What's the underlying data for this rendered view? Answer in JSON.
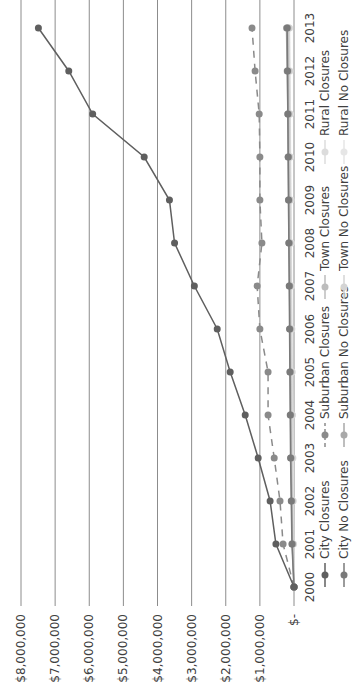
{
  "chart_data": {
    "type": "line",
    "orientation": "rotated 90 degrees counterclockwise",
    "title": "",
    "xlabel": "",
    "ylabel": "",
    "x": [
      "2000",
      "2001",
      "2002",
      "2003",
      "2004",
      "2005",
      "2006",
      "2007",
      "2008",
      "2009",
      "2010",
      "2011",
      "2012",
      "2013"
    ],
    "ylim": [
      0,
      8000000
    ],
    "y_ticks": [
      0,
      1000000,
      2000000,
      3000000,
      4000000,
      5000000,
      6000000,
      7000000,
      8000000
    ],
    "y_tick_labels": [
      "$-",
      "$1,000,000",
      "$2,000,000",
      "$3,000,000",
      "$4,000,000",
      "$5,000,000",
      "$6,000,000",
      "$7,000,000",
      "$8,000,000"
    ],
    "grid": true,
    "legend_position": "bottom",
    "series": [
      {
        "name": "City Closures",
        "color": "#5f5f5f",
        "dash": false,
        "values": [
          0,
          530000,
          700000,
          1050000,
          1430000,
          1870000,
          2250000,
          2920000,
          3500000,
          3650000,
          4390000,
          5900000,
          6600000,
          7490000
        ]
      },
      {
        "name": "City No Closures",
        "color": "#7a7a7a",
        "dash": false,
        "values": [
          0,
          60000,
          80000,
          100000,
          110000,
          120000,
          130000,
          140000,
          150000,
          160000,
          170000,
          180000,
          190000,
          200000
        ]
      },
      {
        "name": "Suburban Closures",
        "color": "#8a8a8a",
        "dash": true,
        "values": [
          0,
          320000,
          410000,
          580000,
          760000,
          760000,
          1000000,
          1080000,
          940000,
          1000000,
          1000000,
          1020000,
          1140000,
          1230000
        ]
      },
      {
        "name": "Suburban No Closures",
        "color": "#a9a9a9",
        "dash": false,
        "values": [
          0,
          50000,
          70000,
          90000,
          100000,
          110000,
          120000,
          130000,
          150000,
          160000,
          170000,
          180000,
          200000,
          220000
        ]
      },
      {
        "name": "Town Closures",
        "color": "#bdbdbd",
        "dash": false,
        "values": [
          0,
          40000,
          60000,
          80000,
          90000,
          100000,
          110000,
          120000,
          130000,
          140000,
          150000,
          160000,
          170000,
          180000
        ]
      },
      {
        "name": "Town No Closures",
        "color": "#d4d4d4",
        "dash": false,
        "values": [
          0,
          30000,
          40000,
          50000,
          60000,
          70000,
          80000,
          90000,
          100000,
          110000,
          120000,
          130000,
          140000,
          150000
        ]
      },
      {
        "name": "Rural Closures",
        "color": "#dcdcdc",
        "dash": false,
        "values": [
          0,
          20000,
          30000,
          40000,
          50000,
          60000,
          70000,
          80000,
          90000,
          100000,
          110000,
          120000,
          130000,
          140000
        ]
      },
      {
        "name": "Rural No Closures",
        "color": "#e6e6e6",
        "dash": false,
        "values": [
          0,
          10000,
          20000,
          30000,
          40000,
          50000,
          60000,
          70000,
          80000,
          90000,
          100000,
          110000,
          120000,
          130000
        ]
      }
    ]
  }
}
